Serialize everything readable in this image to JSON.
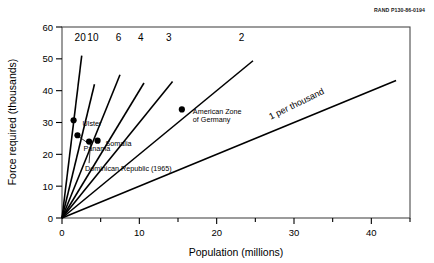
{
  "document_id": "RAND P130-86-0194",
  "chart_data": {
    "type": "line",
    "title": "",
    "xlabel": "Population (millions)",
    "ylabel": "Force required (thousands)",
    "xlim": [
      0,
      45
    ],
    "ylim": [
      0,
      60
    ],
    "xticks": [
      0,
      10,
      20,
      30,
      40
    ],
    "xticklabels": [
      "0",
      "10",
      "20",
      "30",
      "40"
    ],
    "xminorticks": [
      5,
      15,
      25,
      35,
      45
    ],
    "yticks": [
      0,
      10,
      20,
      30,
      40,
      50,
      60
    ],
    "yticklabels": [
      "0",
      "10",
      "20",
      "30",
      "40",
      "50",
      "60"
    ],
    "grid": false,
    "legend": "none",
    "series": [
      {
        "name": "20",
        "label": "20",
        "ratio_per_thousand": 20,
        "slope": 20,
        "x_end": 2.55,
        "y_end": 51.0,
        "label_x": 2.35,
        "label_y": 55.5
      },
      {
        "name": "10",
        "label": "10",
        "ratio_per_thousand": 10,
        "slope": 10,
        "x_end": 4.2,
        "y_end": 42.0,
        "label_x": 4.0,
        "label_y": 55.5
      },
      {
        "name": "6",
        "label": "6",
        "ratio_per_thousand": 6,
        "slope": 6,
        "x_end": 7.5,
        "y_end": 45.0,
        "label_x": 7.3,
        "label_y": 55.5
      },
      {
        "name": "4",
        "label": "4",
        "ratio_per_thousand": 4,
        "slope": 4,
        "x_end": 10.6,
        "y_end": 42.4,
        "label_x": 10.2,
        "label_y": 55.5
      },
      {
        "name": "3",
        "label": "3",
        "ratio_per_thousand": 3,
        "slope": 3,
        "x_end": 14.3,
        "y_end": 42.9,
        "label_x": 13.8,
        "label_y": 55.5
      },
      {
        "name": "2",
        "label": "2",
        "ratio_per_thousand": 2,
        "slope": 2,
        "x_end": 24.7,
        "y_end": 49.4,
        "label_x": 23.2,
        "label_y": 55.5
      },
      {
        "name": "1 per thousand",
        "label": "1 per thousand",
        "ratio_per_thousand": 1,
        "slope": 1,
        "x_end": 43.2,
        "y_end": 43.2,
        "label_x": 30.5,
        "label_y": 35.0
      }
    ],
    "points": [
      {
        "label": "Ulster",
        "x": 1.5,
        "y": 30.7,
        "label_dx": 9,
        "label_dy": 3,
        "leader": false
      },
      {
        "label": "Panama",
        "x": 2.0,
        "y": 26.0,
        "label_dx": 6,
        "label_dy": 13,
        "leader": true
      },
      {
        "label": "Dominican Republic (1965)",
        "x": 3.5,
        "y": 24.0,
        "label_dx": -4,
        "label_dy": 27,
        "leader": true
      },
      {
        "label": "Somalia",
        "x": 4.6,
        "y": 24.3,
        "label_dx": 8,
        "label_dy": 3,
        "leader": false
      },
      {
        "label": "American Zone of Germany",
        "x": 15.5,
        "y": 34.1,
        "label_dx": 11,
        "label_dy": 2,
        "leader": false,
        "label_line2": "of Germany"
      }
    ]
  }
}
